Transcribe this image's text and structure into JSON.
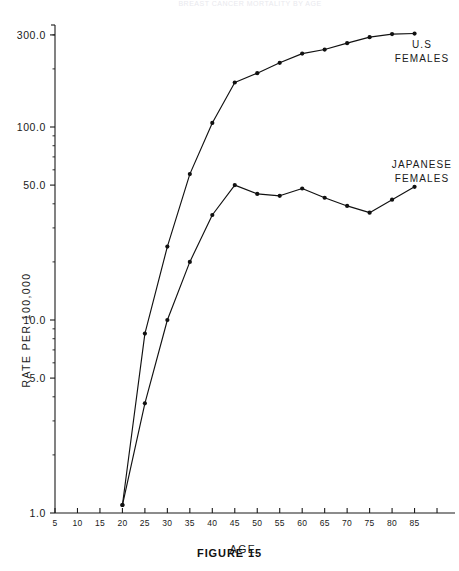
{
  "figure": {
    "caption": "FIGURE 15",
    "faint_top_text": "BREAST CANCER MORTALITY BY AGE"
  },
  "chart_data": {
    "type": "line",
    "title": "",
    "xlabel": "AGE",
    "ylabel": "RATE PER 100,000",
    "yscale": "log",
    "ylim": [
      1.0,
      400.0
    ],
    "xlim": [
      5,
      90
    ],
    "grid": false,
    "legend_position": "inline-right",
    "y_ticks": [
      "1.0",
      "5.0",
      "10.0",
      "50.0",
      "100.0",
      "300.0"
    ],
    "y_tick_values": [
      1.0,
      5.0,
      10.0,
      50.0,
      100.0,
      300.0
    ],
    "x_ticks": [
      "5",
      "10",
      "15",
      "20",
      "25",
      "30",
      "35",
      "40",
      "45",
      "50",
      "55",
      "60",
      "65",
      "70",
      "75",
      "80",
      "85"
    ],
    "x_tick_values": [
      5,
      10,
      15,
      20,
      25,
      30,
      35,
      40,
      45,
      50,
      55,
      60,
      65,
      70,
      75,
      80,
      85
    ],
    "x": [
      20,
      25,
      30,
      35,
      40,
      45,
      50,
      55,
      60,
      65,
      70,
      75,
      80,
      85
    ],
    "series": [
      {
        "name": "U.S FEMALES",
        "label_line1": "U.S",
        "label_line2": "FEMALES",
        "color": "#111111",
        "marker": "dot",
        "values": [
          1.1,
          8.5,
          24.0,
          57.0,
          105.0,
          170.0,
          190.0,
          215.0,
          240.0,
          252.0,
          272.0,
          292.0,
          303.0,
          305.0
        ]
      },
      {
        "name": "JAPANESE FEMALES",
        "label_line1": "JAPANESE",
        "label_line2": "FEMALES",
        "color": "#111111",
        "marker": "dot",
        "values": [
          1.1,
          3.7,
          10.0,
          20.0,
          35.0,
          50.0,
          45.0,
          44.0,
          48.0,
          43.0,
          39.0,
          36.0,
          42.0,
          49.0
        ]
      }
    ]
  }
}
